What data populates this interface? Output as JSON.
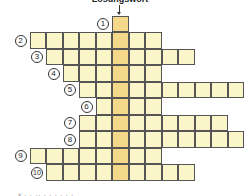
{
  "puzzle": {
    "title": "Lösungswort",
    "cell_size": 16.5,
    "origin_x": 29.5,
    "origin_y": 15.5,
    "solution_col": 5,
    "colors": {
      "cell": "#fbf6c9",
      "solution": "#f5d98a",
      "border": "#555555"
    },
    "rows": [
      {
        "number": "1",
        "start": 5,
        "length": 1
      },
      {
        "number": "2",
        "start": 0,
        "length": 8
      },
      {
        "number": "3",
        "start": 1,
        "length": 9
      },
      {
        "number": "4",
        "start": 2,
        "length": 6
      },
      {
        "number": "5",
        "start": 3,
        "length": 10
      },
      {
        "number": "6",
        "start": 4,
        "length": 4
      },
      {
        "number": "7",
        "start": 3,
        "length": 9
      },
      {
        "number": "8",
        "start": 3,
        "length": 10
      },
      {
        "number": "9",
        "start": 0,
        "length": 8
      },
      {
        "number": "10",
        "start": 1,
        "length": 9
      }
    ]
  },
  "footer": {
    "cut_text": "• ·  · ·· ·  · ·  ·  · ·"
  }
}
